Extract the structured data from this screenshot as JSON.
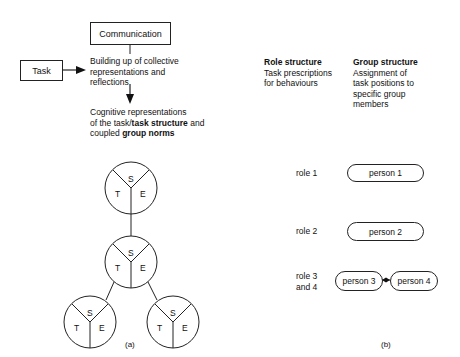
{
  "panel_a": {
    "communication_label": "Communication",
    "task_label": "Task",
    "building_lines": [
      "Building up of collective",
      "representations and",
      "reflections"
    ],
    "cognitive": {
      "line1": "Cognitive representations",
      "line2_prefix": "of the task/",
      "line2_bold": "task structure",
      "line2_suffix": " and",
      "line3_prefix": "coupled ",
      "line3_bold": "group norms"
    },
    "circles": [
      {
        "id": "top",
        "cx": 131,
        "cy": 188,
        "r": 26,
        "labels": {
          "s": "S",
          "t": "T",
          "e": "E"
        }
      },
      {
        "id": "middle",
        "cx": 131,
        "cy": 262,
        "r": 26,
        "labels": {
          "s": "S",
          "t": "T",
          "e": "E"
        }
      },
      {
        "id": "bottom-left",
        "cx": 90,
        "cy": 322,
        "r": 26,
        "labels": {
          "s": "S",
          "t": "T",
          "e": "E"
        }
      },
      {
        "id": "bottom-right",
        "cx": 173,
        "cy": 322,
        "r": 26,
        "labels": {
          "s": "S",
          "t": "T",
          "e": "E"
        }
      }
    ],
    "caption": "(a)"
  },
  "panel_b": {
    "role_structure": {
      "title": "Role structure",
      "lines": [
        "Task prescriptions",
        "for behaviours"
      ]
    },
    "group_structure": {
      "title": "Group structure",
      "lines": [
        "Assignment of",
        "task positions to",
        "specific group",
        "members"
      ]
    },
    "rows": [
      {
        "role": "role 1",
        "persons": [
          "person 1"
        ]
      },
      {
        "role": "role 2",
        "persons": [
          "person 2"
        ]
      },
      {
        "role_lines": [
          "role 3",
          "and 4"
        ],
        "persons": [
          "person 3",
          "person 4"
        ]
      }
    ],
    "caption": "(b)"
  }
}
